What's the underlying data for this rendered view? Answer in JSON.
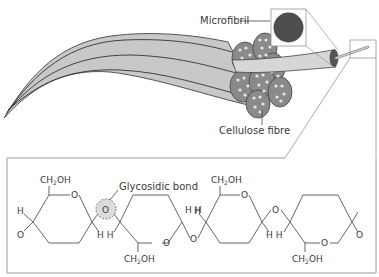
{
  "diagram": {
    "labels": {
      "microfibril": "Microfibril",
      "cellulose_fibre": "Cellulose fibre",
      "glycosidic_bond": "Glycosidic bond"
    },
    "chem": {
      "ch2oh_main": "CH",
      "ch2oh_sub": "2",
      "ch2oh_tail": "OH",
      "h": "H",
      "o": "O",
      "hh": "H H"
    },
    "colors": {
      "fibre_fill": "#c8c8c8",
      "fibre_stroke": "#444444",
      "microfibril_fill": "#555555",
      "bundle_fill": "#8a8a8a",
      "bundle_dot": "#e6e6e6",
      "line": "#555555",
      "box": "#9a9a9a",
      "highlight": "#d9d9d9"
    }
  }
}
